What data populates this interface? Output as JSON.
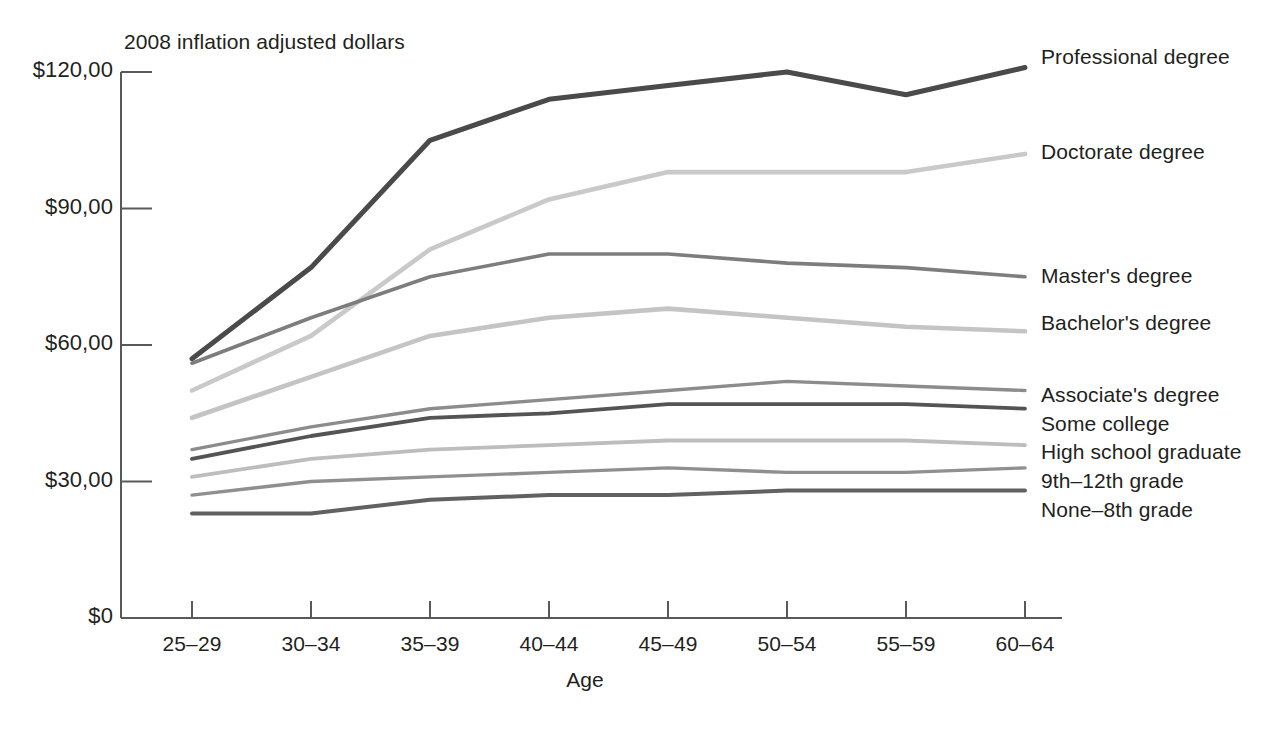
{
  "chart_data": {
    "type": "line",
    "title": "2008 inflation adjusted dollars",
    "subtitle": "",
    "xlabel": "Age",
    "ylabel": "",
    "categories": [
      "25–29",
      "30–34",
      "35–39",
      "40–44",
      "45–49",
      "50–54",
      "55–59",
      "60–64"
    ],
    "ytick_labels": [
      "$120,00",
      "$90,00",
      "$60,00",
      "$30,00",
      "$0"
    ],
    "ytick_values": [
      120000,
      90000,
      60000,
      30000,
      0
    ],
    "ylim": [
      0,
      123000
    ],
    "grid": false,
    "legend_position": "right-inline",
    "series": [
      {
        "name": "Professional degree",
        "color": "#4a4a4a",
        "width": 5.0,
        "values": [
          57000,
          77000,
          105000,
          114000,
          117000,
          120000,
          115000,
          121000
        ]
      },
      {
        "name": "Doctorate degree",
        "color": "#c9c9c9",
        "width": 4.6,
        "values": [
          50000,
          62000,
          81000,
          92000,
          98000,
          98000,
          98000,
          102000
        ]
      },
      {
        "name": "Master's degree",
        "color": "#7d7d7d",
        "width": 3.6,
        "values": [
          56000,
          66000,
          75000,
          80000,
          80000,
          78000,
          77000,
          75000
        ]
      },
      {
        "name": "Bachelor's degree",
        "color": "#c4c4c4",
        "width": 4.6,
        "values": [
          44000,
          53000,
          62000,
          66000,
          68000,
          66000,
          64000,
          63000
        ]
      },
      {
        "name": "Associate's degree",
        "color": "#8c8c8c",
        "width": 3.4,
        "values": [
          37000,
          42000,
          46000,
          48000,
          50000,
          52000,
          51000,
          50000
        ]
      },
      {
        "name": "Some college",
        "color": "#545454",
        "width": 3.8,
        "values": [
          35000,
          40000,
          44000,
          45000,
          47000,
          47000,
          47000,
          46000
        ]
      },
      {
        "name": "High school graduate",
        "color": "#bdbdbd",
        "width": 3.8,
        "values": [
          31000,
          35000,
          37000,
          38000,
          39000,
          39000,
          39000,
          38000
        ]
      },
      {
        "name": "9th–12th grade",
        "color": "#8f8f8f",
        "width": 3.4,
        "values": [
          27000,
          30000,
          31000,
          32000,
          33000,
          32000,
          32000,
          33000
        ]
      },
      {
        "name": "None–8th grade",
        "color": "#616161",
        "width": 4.0,
        "values": [
          23000,
          23000,
          26000,
          27000,
          27000,
          28000,
          28000,
          28000
        ]
      }
    ],
    "series_label_positions": [
      {
        "name": "Professional degree",
        "y": 45
      },
      {
        "name": "Doctorate degree",
        "y": 140
      },
      {
        "name": "Master's degree",
        "y": 264
      },
      {
        "name": "Bachelor's degree",
        "y": 311
      },
      {
        "name": "Associate's degree",
        "y": 383
      },
      {
        "name": "Some college",
        "y": 412
      },
      {
        "name": "High school graduate",
        "y": 440
      },
      {
        "name": "9th–12th grade",
        "y": 469
      },
      {
        "name": "None–8th grade",
        "y": 498
      }
    ],
    "axis": {
      "color": "#58595b",
      "plot_left": 192,
      "plot_right": 1025,
      "axis_line_right": 1062,
      "baseline_y": 618,
      "top_y": 72
    }
  }
}
